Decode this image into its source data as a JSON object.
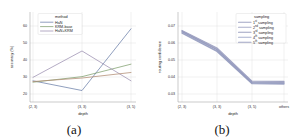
{
  "figure": {
    "panel_a_label": "(a)",
    "panel_b_label": "(b)"
  },
  "chart_data": [
    {
      "id": "panel-a",
      "type": "line",
      "title": "",
      "xlabel": "depth",
      "ylabel": "accuracy (%)",
      "categories": [
        "(2, 3)",
        "(3, 3)",
        "(3, 5)"
      ],
      "ytick_labels": [
        "20",
        "30",
        "40",
        "50",
        "60"
      ],
      "ytick_values": [
        20,
        30,
        40,
        50,
        60
      ],
      "ylim": [
        15,
        64
      ],
      "grid": true,
      "legend_position": "upper-left",
      "legend_title": "method",
      "series": [
        {
          "name": "HaN",
          "color": "#6b7fa8",
          "values": [
            24.5,
            17.5,
            62.0
          ]
        },
        {
          "name": "KRM-base",
          "color": "#7f9f6e",
          "values": [
            23.5,
            27.5,
            36.5
          ]
        },
        {
          "name": "HaN+KRM",
          "color": "#9b8fb0",
          "values": [
            27.0,
            46.0,
            24.5
          ]
        },
        {
          "name": "method-4",
          "color": "#b08b72",
          "values": [
            24.0,
            26.5,
            30.5
          ]
        }
      ]
    },
    {
      "id": "panel-b",
      "type": "line",
      "title": "",
      "xlabel": "depth",
      "ylabel": "routing confidence",
      "categories": [
        "(2, 3)",
        "(3, 3)",
        "(3, 5)",
        "others"
      ],
      "ytick_labels": [
        "0.03",
        "0.04",
        "0.05",
        "0.06",
        "0.07"
      ],
      "ytick_values": [
        0.03,
        0.04,
        0.05,
        0.06,
        0.07
      ],
      "ylim": [
        0.027,
        0.0735
      ],
      "grid": true,
      "legend_position": "upper-right",
      "legend_title": "sampling",
      "series": [
        {
          "name": "1",
          "suffix": "st",
          "label_tail": " sampling",
          "color": "#8d93b8",
          "values": [
            0.0705,
            0.0585,
            0.0358,
            0.0356
          ]
        },
        {
          "name": "2",
          "suffix": "nd",
          "label_tail": " sampling",
          "color": "#9a9ec0",
          "values": [
            0.07,
            0.0578,
            0.0352,
            0.035
          ]
        },
        {
          "name": "3",
          "suffix": "rd",
          "label_tail": " sampling",
          "color": "#8a8fb4",
          "values": [
            0.0695,
            0.0572,
            0.0348,
            0.0346
          ]
        },
        {
          "name": "4",
          "suffix": "th",
          "label_tail": " sampling",
          "color": "#96a0c4",
          "values": [
            0.069,
            0.0566,
            0.0344,
            0.0342
          ]
        },
        {
          "name": "5",
          "suffix": "th",
          "label_tail": " sampling",
          "color": "#8f95ba",
          "values": [
            0.0685,
            0.056,
            0.034,
            0.0338
          ]
        }
      ]
    }
  ]
}
